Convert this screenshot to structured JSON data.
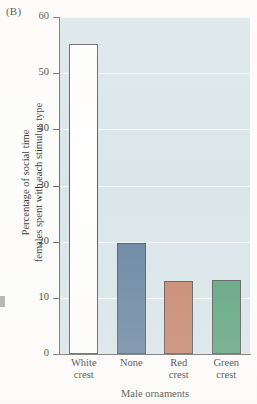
{
  "panel": {
    "label": "(B)"
  },
  "chart_data": {
    "type": "bar",
    "title": "",
    "xlabel": "Male ornaments",
    "ylabel_line1": "Percentage of social time",
    "ylabel_line2": "females spent with each stimulus type",
    "categories": [
      "White crest",
      "None",
      "Red crest",
      "Green crest"
    ],
    "category_lines": [
      [
        "White",
        "crest"
      ],
      [
        "None",
        ""
      ],
      [
        "Red",
        "crest"
      ],
      [
        "Green",
        "crest"
      ]
    ],
    "values": [
      55.2,
      19.8,
      13.0,
      13.2
    ],
    "bar_colors": [
      "#ffffff",
      "#5a7a9a",
      "#c07a5e",
      "#4e9b72"
    ],
    "bar_outline": "#4a4a4a",
    "ylim": [
      0,
      60
    ],
    "yticks": [
      0,
      10,
      20,
      30,
      40,
      50,
      60
    ],
    "ytick_labels": [
      "0",
      "10",
      "20",
      "30",
      "40",
      "50",
      "60"
    ],
    "grid": true,
    "grid_color": "#ffffff",
    "plot_background": "#d6e4e9",
    "legend": "none"
  }
}
